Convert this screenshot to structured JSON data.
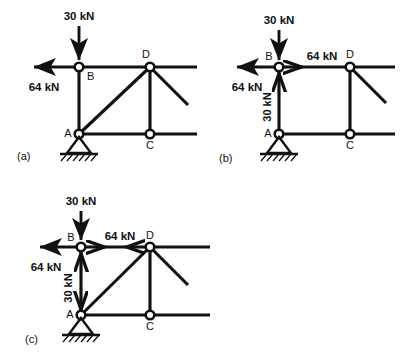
{
  "figure": {
    "node_labels": {
      "a": "A",
      "b": "B",
      "c": "C",
      "d": "D"
    },
    "loads": {
      "vertical": "30 kN",
      "horizontal": "64 kN"
    }
  },
  "panels": [
    {
      "tag": "(a)",
      "name": "panel-a-full-truss",
      "has_diagonal_ad": true,
      "nodes": {
        "a": "A",
        "b": "B",
        "c": "C",
        "d": "D"
      },
      "external_forces": [
        {
          "name": "load-30kn-at-b",
          "label": "30 kN",
          "direction": "down"
        },
        {
          "name": "load-64kn-at-b",
          "label": "64 kN",
          "direction": "left"
        }
      ],
      "internal_forces": []
    },
    {
      "tag": "(b)",
      "name": "panel-b-member-removed",
      "has_diagonal_ad": false,
      "nodes": {
        "a": "A",
        "b": "B",
        "c": "C",
        "d": "D"
      },
      "external_forces": [
        {
          "name": "load-30kn-at-b",
          "label": "30 kN",
          "direction": "down"
        },
        {
          "name": "load-64kn-at-b",
          "label": "64 kN",
          "direction": "left"
        }
      ],
      "internal_forces": [
        {
          "name": "force-64kn-bd",
          "label": "64 kN",
          "direction": "right",
          "member": "B-D"
        },
        {
          "name": "force-30kn-ba",
          "label": "30 kN",
          "direction": "up",
          "member": "B-A"
        }
      ]
    },
    {
      "tag": "(c)",
      "name": "panel-c-action-reaction",
      "has_diagonal_ad": true,
      "nodes": {
        "a": "A",
        "b": "B",
        "c": "C",
        "d": "D"
      },
      "external_forces": [
        {
          "name": "load-30kn-at-b",
          "label": "30 kN",
          "direction": "down"
        },
        {
          "name": "load-64kn-at-b",
          "label": "64 kN",
          "direction": "left"
        }
      ],
      "internal_forces": [
        {
          "name": "force-64kn-bd-right",
          "label": "64 kN",
          "direction": "right",
          "member": "B-D"
        },
        {
          "name": "force-64kn-db-left",
          "label": "",
          "direction": "left",
          "member": "D-B"
        },
        {
          "name": "force-30kn-b-up",
          "label": "30 kN",
          "direction": "up",
          "member": "B-A"
        },
        {
          "name": "force-30kn-a-down",
          "label": "",
          "direction": "down",
          "member": "B-A"
        }
      ]
    }
  ],
  "colors": {
    "ink": "#111111",
    "background": "#ffffff"
  }
}
